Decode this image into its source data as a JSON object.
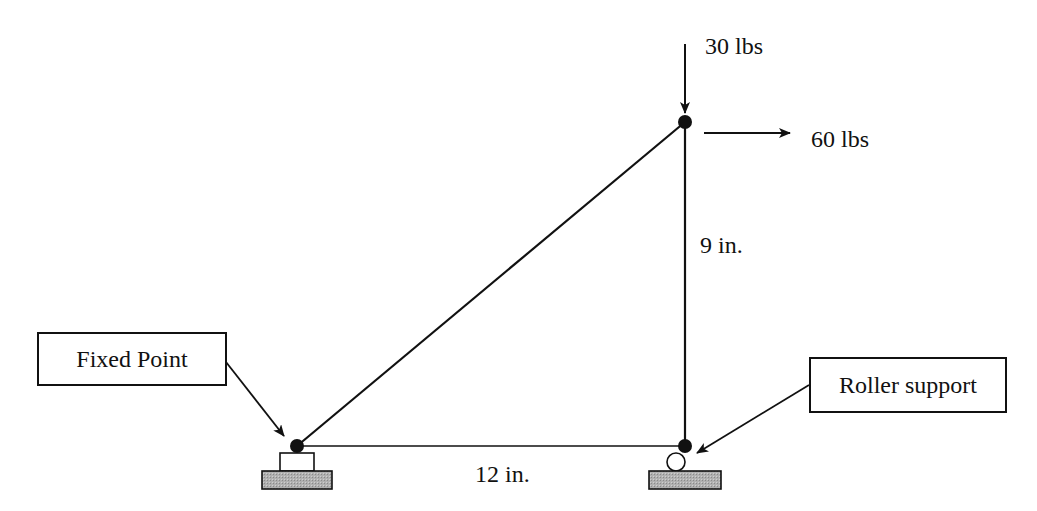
{
  "diagram": {
    "type": "truss",
    "loads": {
      "vertical": "30 lbs",
      "horizontal": "60 lbs"
    },
    "dimensions": {
      "height": "9 in.",
      "base": "12 in."
    },
    "callouts": {
      "fixed": "Fixed Point",
      "roller": "Roller support"
    },
    "colors": {
      "line": "#111111",
      "ground_fill": "#a8a8a8"
    }
  }
}
